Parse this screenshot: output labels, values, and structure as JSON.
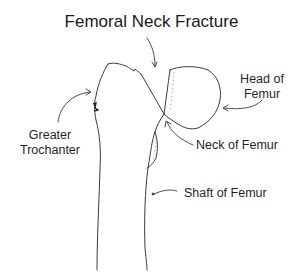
{
  "diagram": {
    "title": "Femoral Neck Fracture",
    "labels": {
      "head_line1": "Head of",
      "head_line2": "Femur",
      "trochanter_line1": "Greater",
      "trochanter_line2": "Trochanter",
      "neck": "Neck of Femur",
      "shaft": "Shaft of Femur"
    },
    "colors": {
      "line": "#3a3a3a",
      "text": "#1f1f1f",
      "background": "#ffffff"
    }
  }
}
